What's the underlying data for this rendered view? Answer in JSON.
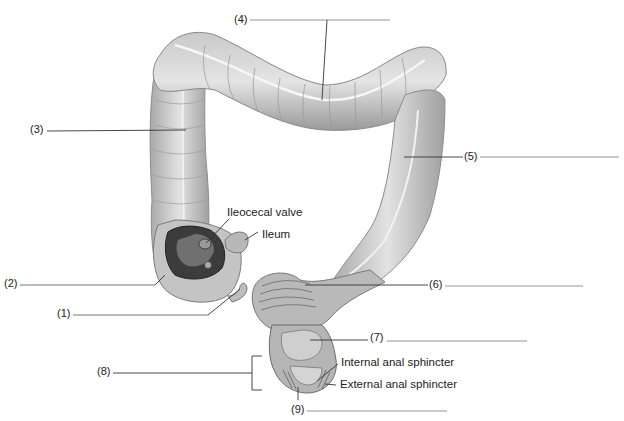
{
  "diagram": {
    "blank_labels": [
      {
        "id": "1",
        "text": "(1)"
      },
      {
        "id": "2",
        "text": "(2)"
      },
      {
        "id": "3",
        "text": "(3)"
      },
      {
        "id": "4",
        "text": "(4)"
      },
      {
        "id": "5",
        "text": "(5)"
      },
      {
        "id": "6",
        "text": "(6)"
      },
      {
        "id": "7",
        "text": "(7)"
      },
      {
        "id": "8",
        "text": "(8)"
      },
      {
        "id": "9",
        "text": "(9)"
      }
    ],
    "named_labels": {
      "ileocecal_valve": "Ileocecal valve",
      "ileum": "Ileum",
      "internal_anal_sphincter": "Internal anal sphincter",
      "external_anal_sphincter": "External anal sphincter"
    },
    "colors": {
      "background": "#ffffff",
      "organ_light": "#d8d8d8",
      "organ_mid": "#a8a8a8",
      "organ_dark": "#555555",
      "line": "#333333"
    }
  }
}
